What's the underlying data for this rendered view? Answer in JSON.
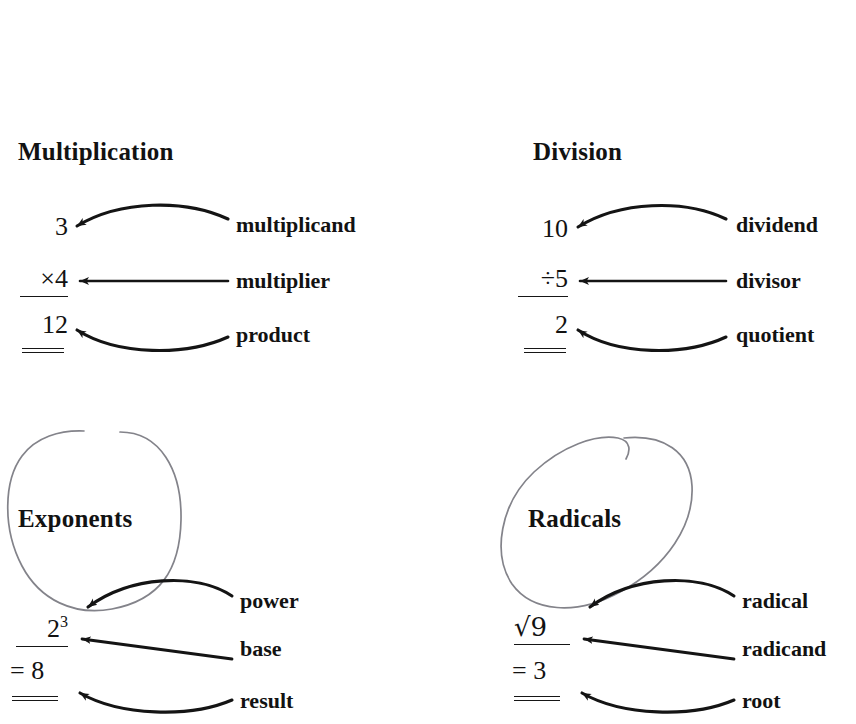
{
  "page": {
    "background": "#ffffff",
    "ink": "#121212",
    "annotation_color": "#6f6f72",
    "width": 856,
    "height": 724
  },
  "sections": [
    {
      "id": "multiplication",
      "heading": "Multiplication",
      "circled": false,
      "expression": {
        "line1": "3",
        "line2": "×4",
        "line3": "12"
      },
      "labels": [
        {
          "id": "multiplicand",
          "text": "multiplicand",
          "arrow": "curve-up"
        },
        {
          "id": "multiplier",
          "text": "multiplier",
          "arrow": "straight"
        },
        {
          "id": "product",
          "text": "product",
          "arrow": "curve-down"
        }
      ]
    },
    {
      "id": "division",
      "heading": "Division",
      "circled": false,
      "expression": {
        "line1": "10",
        "line2": "÷5",
        "line3": "2"
      },
      "labels": [
        {
          "id": "dividend",
          "text": "dividend",
          "arrow": "curve-up"
        },
        {
          "id": "divisor",
          "text": "divisor",
          "arrow": "straight"
        },
        {
          "id": "quotient",
          "text": "quotient",
          "arrow": "curve-down"
        }
      ]
    },
    {
      "id": "exponents",
      "heading": "Exponents",
      "circled": true,
      "expression": {
        "base": "2",
        "exponent": "3",
        "line3": "= 8"
      },
      "labels": [
        {
          "id": "power",
          "text": "power",
          "arrow": "curve-up"
        },
        {
          "id": "base",
          "text": "base",
          "arrow": "straight"
        },
        {
          "id": "result",
          "text": "result",
          "arrow": "curve-down"
        }
      ]
    },
    {
      "id": "radicals",
      "heading": "Radicals",
      "circled": true,
      "expression": {
        "line2": "√9",
        "line3": "= 3"
      },
      "labels": [
        {
          "id": "radical",
          "text": "radical",
          "arrow": "curve-up"
        },
        {
          "id": "radicand",
          "text": "radicand",
          "arrow": "straight"
        },
        {
          "id": "root",
          "text": "root",
          "arrow": "curve-down"
        }
      ]
    }
  ]
}
